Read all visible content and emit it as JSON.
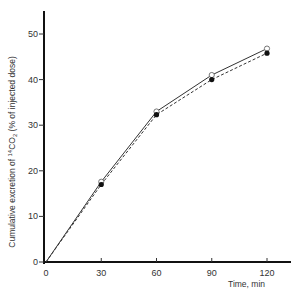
{
  "chart_data": {
    "type": "line",
    "title": "",
    "xlabel": "Time, min",
    "ylabel": "Cumulative excretion of 14CO2 (% of injected dose)",
    "ylabel_parts": {
      "main": "Cumulative excretion of ",
      "sup": "14",
      "chem": "CO",
      "sub": "2",
      "tail": "   (% of injected dose)"
    },
    "x": [
      0,
      30,
      60,
      90,
      120
    ],
    "x_ticks": [
      "0",
      "30",
      "60",
      "90",
      "120"
    ],
    "y_ticks": [
      "0",
      "10",
      "20",
      "30",
      "40",
      "50"
    ],
    "xlim": [
      0,
      128
    ],
    "ylim": [
      0,
      55
    ],
    "grid": false,
    "legend": null,
    "series": [
      {
        "name": "open circles (solid line)",
        "marker": "open-circle",
        "line": "solid",
        "values": [
          0,
          17.6,
          33.0,
          41.0,
          46.8
        ]
      },
      {
        "name": "filled circles (dashed line)",
        "marker": "filled-circle",
        "line": "dashed",
        "values": [
          0,
          17.0,
          32.3,
          40.0,
          45.8
        ]
      }
    ]
  }
}
